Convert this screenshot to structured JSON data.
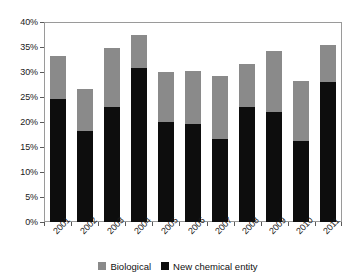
{
  "chart_data": {
    "type": "bar",
    "subtype": "stacked-bar",
    "title": "",
    "subtitle": "",
    "xlabel": "",
    "ylabel": "",
    "categories": [
      "2001",
      "2002",
      "2003",
      "2004",
      "2005",
      "2006",
      "2007",
      "2008",
      "2009",
      "2010",
      "2011"
    ],
    "series": [
      {
        "name": "New chemical entity",
        "color": "#0d0d0d",
        "values": [
          24.6,
          18.2,
          23.0,
          30.8,
          20.0,
          19.6,
          16.6,
          23.0,
          22.0,
          16.2,
          28.0
        ]
      },
      {
        "name": "Biological",
        "color": "#8a8a8a",
        "values": [
          8.7,
          8.4,
          11.8,
          6.6,
          10.0,
          10.6,
          12.6,
          8.6,
          12.2,
          12.0,
          7.4
        ]
      }
    ],
    "totals": [
      33.3,
      26.6,
      34.8,
      37.4,
      30.0,
      30.2,
      29.2,
      31.6,
      34.2,
      28.2,
      35.4
    ],
    "ylim": [
      0,
      40
    ],
    "ytick_values": [
      0,
      5,
      10,
      15,
      20,
      25,
      30,
      35,
      40
    ],
    "ytick_labels": [
      "0%",
      "5%",
      "10%",
      "15%",
      "20%",
      "25%",
      "30%",
      "35%",
      "40%"
    ],
    "grid": false,
    "legend_position": "bottom",
    "legend_entries": [
      {
        "label": "Biological",
        "color": "#8a8a8a"
      },
      {
        "label": "New chemical entity",
        "color": "#0d0d0d"
      }
    ],
    "stack_order_bottom_to_top": [
      "New chemical entity",
      "Biological"
    ]
  }
}
